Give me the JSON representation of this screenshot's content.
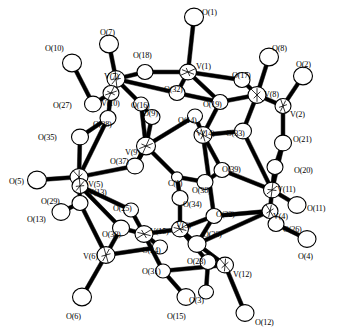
{
  "figure": {
    "kind": "crystal-structure-ortep-diagram",
    "background_color": "#ffffff",
    "line_color": "#000000",
    "atom_fill_color": "#ffffff",
    "width": 337,
    "height": 334
  },
  "chart_data": {
    "type": "scatter",
    "xlabel": "",
    "ylabel": "",
    "xlim": [
      0,
      337
    ],
    "ylim": [
      0,
      334
    ],
    "grid": false,
    "legend": null,
    "series": [
      {
        "name": "vanadium",
        "element": "V",
        "count": 15,
        "points": [
          {
            "label": "V(1)",
            "x": 188,
            "y": 72,
            "r": 8.5,
            "lx": 196,
            "ly": 63
          },
          {
            "label": "V(2)",
            "x": 283,
            "y": 106,
            "r": 8.0,
            "lx": 290,
            "ly": 111
          },
          {
            "label": "V(3)",
            "x": 180,
            "y": 229,
            "r": 8.5,
            "lx": 176,
            "ly": 222
          },
          {
            "label": "V(4)",
            "x": 270,
            "y": 211,
            "r": 8.0,
            "lx": 273,
            "ly": 213
          },
          {
            "label": "V(5)",
            "x": 79,
            "y": 177,
            "r": 9.0,
            "lx": 88,
            "ly": 181
          },
          {
            "label": "V(6)",
            "x": 106,
            "y": 255,
            "r": 9.0,
            "lx": 83,
            "ly": 253
          },
          {
            "label": "V(7)",
            "x": 116,
            "y": 79,
            "r": 9.0,
            "lx": 104,
            "ly": 73
          },
          {
            "label": "V(8)",
            "x": 257,
            "y": 95,
            "r": 9.0,
            "lx": 264,
            "ly": 91
          },
          {
            "label": "V(9)",
            "x": 146,
            "y": 146,
            "r": 9.5,
            "lx": 125,
            "ly": 149
          },
          {
            "label": "V(10)",
            "x": 111,
            "y": 93,
            "r": 8.0,
            "lx": 101,
            "ly": 100
          },
          {
            "label": "V(11)",
            "x": 272,
            "y": 190,
            "r": 8.5,
            "lx": 277,
            "ly": 186
          },
          {
            "label": "V(12)",
            "x": 225,
            "y": 265,
            "r": 8.5,
            "lx": 233,
            "ly": 271
          },
          {
            "label": "V(13)",
            "x": 80,
            "y": 186,
            "r": 8.0,
            "lx": 88,
            "ly": 189
          },
          {
            "label": "V(14)",
            "x": 203,
            "y": 135,
            "r": 9.0,
            "lx": 196,
            "ly": 130
          },
          {
            "label": "V(15)",
            "x": 144,
            "y": 234,
            "r": 9.0,
            "lx": 150,
            "ly": 228
          }
        ]
      },
      {
        "name": "oxygen-terminal",
        "element": "O",
        "count": 16,
        "points": [
          {
            "label": "O(1)",
            "x": 194,
            "y": 17,
            "r": 9.5,
            "lx": 202,
            "ly": 9
          },
          {
            "label": "O(2)",
            "x": 303,
            "y": 76,
            "r": 9.5,
            "lx": 296,
            "ly": 61
          },
          {
            "label": "O(3)",
            "x": 206,
            "y": 292,
            "r": 7.5,
            "lx": 189,
            "ly": 297
          },
          {
            "label": "O(4)",
            "x": 307,
            "y": 239,
            "r": 9.0,
            "lx": 298,
            "ly": 253
          },
          {
            "label": "O(5)",
            "x": 37,
            "y": 180,
            "r": 9.5,
            "lx": 9,
            "ly": 178
          },
          {
            "label": "O(6)",
            "x": 82,
            "y": 297,
            "r": 9.5,
            "lx": 66,
            "ly": 313
          },
          {
            "label": "O(7)",
            "x": 109,
            "y": 44,
            "r": 9.5,
            "lx": 100,
            "ly": 29
          },
          {
            "label": "O(8)",
            "x": 269,
            "y": 57,
            "r": 9.5,
            "lx": 272,
            "ly": 45
          },
          {
            "label": "O(11)",
            "x": 297,
            "y": 205,
            "r": 9.0,
            "lx": 307,
            "ly": 205
          },
          {
            "label": "O(12)",
            "x": 245,
            "y": 313,
            "r": 9.0,
            "lx": 255,
            "ly": 319
          },
          {
            "label": "O(13)",
            "x": 61,
            "y": 212,
            "r": 9.0,
            "lx": 27,
            "ly": 216
          },
          {
            "label": "O(15)",
            "x": 186,
            "y": 297,
            "r": 9.0,
            "lx": 167,
            "ly": 313
          },
          {
            "label": "O(10)",
            "x": 72,
            "y": 63,
            "r": 9.5,
            "lx": 45,
            "ly": 45
          },
          {
            "label": "O(20)",
            "x": 275,
            "y": 167,
            "r": 8.0,
            "lx": 294,
            "ly": 167
          },
          {
            "label": "O(21)",
            "x": 283,
            "y": 143,
            "r": 8.5,
            "lx": 293,
            "ly": 136
          },
          {
            "label": "O(26)",
            "x": 276,
            "y": 224,
            "r": 8.0,
            "lx": 283,
            "ly": 226
          }
        ]
      },
      {
        "name": "oxygen-bridging",
        "element": "O",
        "count": 23,
        "points": [
          {
            "label": "O(9)",
            "x": 152,
            "y": 117,
            "r": 8.0,
            "lx": 143,
            "ly": 110
          },
          {
            "label": "O(14)",
            "x": 195,
            "y": 116,
            "r": 7.5,
            "lx": 178,
            "ly": 117
          },
          {
            "label": "O(16)",
            "x": 141,
            "y": 104,
            "r": 7.5,
            "lx": 131,
            "ly": 102
          },
          {
            "label": "O(17)",
            "x": 242,
            "y": 80,
            "r": 8.0,
            "lx": 232,
            "ly": 72
          },
          {
            "label": "O(18)",
            "x": 145,
            "y": 72,
            "r": 8.0,
            "lx": 133,
            "ly": 52
          },
          {
            "label": "O(19)",
            "x": 220,
            "y": 102,
            "r": 8.0,
            "lx": 203,
            "ly": 101
          },
          {
            "label": "O(22)",
            "x": 214,
            "y": 216,
            "r": 8.0,
            "lx": 216,
            "ly": 211
          },
          {
            "label": "O(23)",
            "x": 208,
            "y": 262,
            "r": 8.0,
            "lx": 187,
            "ly": 258
          },
          {
            "label": "O(24)",
            "x": 160,
            "y": 247,
            "r": 7.5,
            "lx": 142,
            "ly": 247
          },
          {
            "label": "O(25)",
            "x": 131,
            "y": 210,
            "r": 7.5,
            "lx": 113,
            "ly": 205
          },
          {
            "label": "O(27)",
            "x": 93,
            "y": 104,
            "r": 8.5,
            "lx": 53,
            "ly": 102
          },
          {
            "label": "O(28)",
            "x": 108,
            "y": 118,
            "r": 8.0,
            "lx": 93,
            "ly": 121
          },
          {
            "label": "O(29)",
            "x": 80,
            "y": 203,
            "r": 8.0,
            "lx": 41,
            "ly": 198
          },
          {
            "label": "O(30)",
            "x": 121,
            "y": 228,
            "r": 8.5,
            "lx": 102,
            "ly": 231
          },
          {
            "label": "O(31)",
            "x": 163,
            "y": 271,
            "r": 7.5,
            "lx": 142,
            "ly": 268
          },
          {
            "label": "O(32)",
            "x": 177,
            "y": 93,
            "r": 8.0,
            "lx": 164,
            "ly": 86
          },
          {
            "label": "O(33)",
            "x": 243,
            "y": 131,
            "r": 8.5,
            "lx": 226,
            "ly": 130
          },
          {
            "label": "O(34)",
            "x": 180,
            "y": 198,
            "r": 8.0,
            "lx": 183,
            "ly": 201
          },
          {
            "label": "O(35)",
            "x": 80,
            "y": 137,
            "r": 8.5,
            "lx": 38,
            "ly": 134
          },
          {
            "label": "O(36)",
            "x": 197,
            "y": 244,
            "r": 9.0,
            "lx": 203,
            "ly": 231
          },
          {
            "label": "O(37)",
            "x": 135,
            "y": 166,
            "r": 8.5,
            "lx": 110,
            "ly": 158
          },
          {
            "label": "O(38)",
            "x": 205,
            "y": 182,
            "r": 8.0,
            "lx": 192,
            "ly": 187
          },
          {
            "label": "O(39)",
            "x": 222,
            "y": 170,
            "r": 8.0,
            "lx": 222,
            "ly": 166
          }
        ]
      },
      {
        "name": "carbon",
        "element": "C",
        "count": 1,
        "points": [
          {
            "label": "C(1)",
            "x": 177,
            "y": 177,
            "r": 5.5,
            "lx": 168,
            "ly": 180
          }
        ]
      }
    ],
    "bonds": [
      [
        "O(1)",
        "V(1)"
      ],
      [
        "V(1)",
        "O(32)"
      ],
      [
        "V(1)",
        "O(18)"
      ],
      [
        "V(1)",
        "O(19)"
      ],
      [
        "V(1)",
        "O(17)"
      ],
      [
        "O(17)",
        "V(8)"
      ],
      [
        "O(8)",
        "V(8)"
      ],
      [
        "V(8)",
        "O(19)"
      ],
      [
        "V(8)",
        "V(2)"
      ],
      [
        "V(2)",
        "O(2)"
      ],
      [
        "V(2)",
        "O(21)"
      ],
      [
        "O(21)",
        "V(11)"
      ],
      [
        "V(8)",
        "O(33)"
      ],
      [
        "O(33)",
        "V(11)"
      ],
      [
        "O(20)",
        "V(11)"
      ],
      [
        "O(21)",
        "O(20)"
      ],
      [
        "V(11)",
        "O(11)"
      ],
      [
        "V(11)",
        "V(4)"
      ],
      [
        "V(4)",
        "O(26)"
      ],
      [
        "O(26)",
        "O(4)"
      ],
      [
        "V(4)",
        "O(22)"
      ],
      [
        "O(22)",
        "V(14)"
      ],
      [
        "V(14)",
        "O(19)"
      ],
      [
        "V(14)",
        "O(14)"
      ],
      [
        "V(14)",
        "O(39)"
      ],
      [
        "O(39)",
        "O(38)"
      ],
      [
        "V(14)",
        "O(33)"
      ],
      [
        "O(32)",
        "V(7)"
      ],
      [
        "O(18)",
        "V(7)"
      ],
      [
        "V(7)",
        "O(7)"
      ],
      [
        "V(7)",
        "V(10)"
      ],
      [
        "V(7)",
        "O(16)"
      ],
      [
        "V(10)",
        "O(27)"
      ],
      [
        "O(27)",
        "O(10)"
      ],
      [
        "V(10)",
        "O(28)"
      ],
      [
        "O(28)",
        "O(35)"
      ],
      [
        "O(35)",
        "V(5)"
      ],
      [
        "V(5)",
        "O(5)"
      ],
      [
        "V(5)",
        "V(13)"
      ],
      [
        "V(5)",
        "O(29)"
      ],
      [
        "O(29)",
        "O(13)"
      ],
      [
        "V(5)",
        "O(37)"
      ],
      [
        "O(37)",
        "V(9)"
      ],
      [
        "V(9)",
        "O(9)"
      ],
      [
        "O(9)",
        "O(16)"
      ],
      [
        "V(9)",
        "O(14)"
      ],
      [
        "V(9)",
        "C(1)"
      ],
      [
        "C(1)",
        "O(34)"
      ],
      [
        "C(1)",
        "O(38)"
      ],
      [
        "O(34)",
        "V(3)"
      ],
      [
        "V(3)",
        "O(36)"
      ],
      [
        "O(36)",
        "V(12)"
      ],
      [
        "V(12)",
        "O(12)"
      ],
      [
        "V(12)",
        "O(23)"
      ],
      [
        "O(23)",
        "V(3)"
      ],
      [
        "V(3)",
        "O(22)"
      ],
      [
        "O(36)",
        "V(4)"
      ],
      [
        "O(23)",
        "O(3)"
      ],
      [
        "V(3)",
        "V(15)"
      ],
      [
        "V(15)",
        "O(24)"
      ],
      [
        "V(15)",
        "O(31)"
      ],
      [
        "O(31)",
        "O(15)"
      ],
      [
        "V(15)",
        "O(25)"
      ],
      [
        "O(25)",
        "V(13)"
      ],
      [
        "V(15)",
        "O(30)"
      ],
      [
        "O(30)",
        "V(6)"
      ],
      [
        "V(6)",
        "O(6)"
      ],
      [
        "V(6)",
        "O(29)"
      ],
      [
        "V(6)",
        "O(24)"
      ],
      [
        "O(30)",
        "V(13)"
      ],
      [
        "V(9)",
        "O(37)"
      ],
      [
        "O(32)",
        "O(19)"
      ],
      [
        "O(28)",
        "V(5)"
      ],
      [
        "O(16)",
        "V(9)"
      ],
      [
        "O(22)",
        "O(36)"
      ],
      [
        "O(39)",
        "V(11)"
      ],
      [
        "V(12)",
        "O(31)"
      ]
    ]
  },
  "labels": {
    "vanadium_prefix": "V",
    "oxygen_prefix": "O",
    "carbon_prefix": "C"
  }
}
